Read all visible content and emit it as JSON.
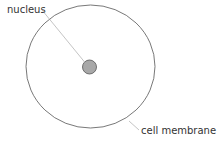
{
  "diagram": {
    "labels": {
      "nucleus": "nucleus",
      "cell_membrane": "cell membrane"
    },
    "colors": {
      "membrane_stroke": "#555555",
      "nucleus_fill": "#a8a8a8",
      "nucleus_stroke": "#555555",
      "leader_line": "#aaaaaa",
      "text": "#333333"
    }
  }
}
